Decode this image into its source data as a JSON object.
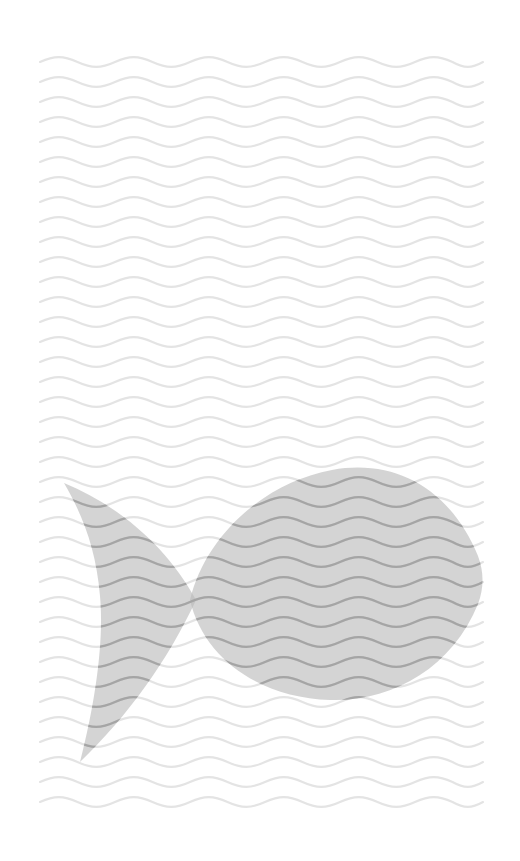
{
  "artwork": {
    "title": "Fish Silhouette on Wave Pattern",
    "kind": "flat-illustration",
    "canvas": {
      "width": 520,
      "height": 861,
      "background_color": "#ffffff"
    },
    "background_pattern": {
      "name": "wavy-lines-pattern",
      "line_color": "#e4e4e4",
      "line_width": 2.1,
      "wave_period_px": 75,
      "wave_amplitude_px": 6.5,
      "row_spacing_px": 20,
      "region": {
        "x": 40,
        "y": 62,
        "width": 443,
        "height": 750
      },
      "row_count": 38
    },
    "subject": {
      "name": "fish-shape",
      "fill_color": "#b9b9b9",
      "fill_opacity": 0.62,
      "wave_overlay_color": "#a5a5a5",
      "orientation": "facing-right",
      "bounding_box": {
        "x": 64,
        "y": 466,
        "width": 420,
        "height": 296
      },
      "parts": [
        {
          "name": "body",
          "description": "almond lens body with pointed snout at right"
        },
        {
          "name": "tail",
          "description": "crescent caudal fin with V notch at left"
        }
      ],
      "body_path": "M 190 600 C 206 534 266 482 332 470 C 398 458 452 492 478 556 C 484 572 484 588 478 604 C 452 668 392 702 330 700 C 262 698 204 660 190 600 Z",
      "tail_path": "M 64 483 C 120 506 168 548 196 600 C 168 660 128 716 80 762 C 96 700 104 640 100 596 C 96 548 82 514 64 483 Z",
      "head_point": {
        "x": 483,
        "y": 580
      },
      "tail_upper_tip": {
        "x": 64,
        "y": 483
      },
      "tail_lower_tip": {
        "x": 80,
        "y": 762
      },
      "notch_upper": {
        "x": 172,
        "y": 535
      },
      "notch_lower": {
        "x": 190,
        "y": 664
      }
    },
    "palette": {
      "white": "#ffffff",
      "wave_light": "#e4e4e4",
      "fish_gray": "#b9b9b9",
      "fish_wave_gray": "#a5a5a5"
    }
  }
}
